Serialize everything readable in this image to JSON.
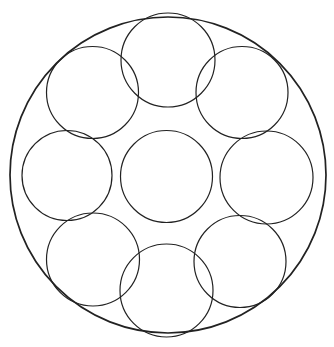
{
  "diagram": {
    "type": "circle-packing",
    "canvas": {
      "width": 334,
      "height": 347
    },
    "colors": {
      "background": "#ffffff",
      "stroke": "#222222"
    },
    "outer_circle": {
      "cx": 168,
      "cy": 175,
      "r": 158,
      "stroke_width": 1.7
    },
    "inner_circles": [
      {
        "name": "center",
        "cx": 166.5,
        "cy": 176.5,
        "r": 46,
        "stroke_width": 1.2
      },
      {
        "name": "top",
        "cx": 168,
        "cy": 60,
        "r": 47,
        "stroke_width": 1.2
      },
      {
        "name": "top-right",
        "cx": 242,
        "cy": 92.5,
        "r": 46,
        "stroke_width": 1.2
      },
      {
        "name": "right",
        "cx": 266.5,
        "cy": 177.5,
        "r": 46.5,
        "stroke_width": 1.2
      },
      {
        "name": "bottom-right",
        "cx": 240,
        "cy": 261.5,
        "r": 46,
        "stroke_width": 1.2
      },
      {
        "name": "bottom",
        "cx": 166.5,
        "cy": 290.5,
        "r": 46.5,
        "stroke_width": 1.2
      },
      {
        "name": "bottom-left",
        "cx": 93,
        "cy": 259.5,
        "r": 46.5,
        "stroke_width": 1.2
      },
      {
        "name": "left",
        "cx": 67,
        "cy": 175.5,
        "r": 45,
        "stroke_width": 1.2
      },
      {
        "name": "top-left",
        "cx": 92.5,
        "cy": 92.5,
        "r": 46,
        "stroke_width": 1.2
      }
    ]
  }
}
